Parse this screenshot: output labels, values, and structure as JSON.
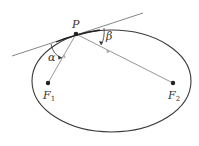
{
  "diagram": {
    "labels": {
      "point": "P",
      "alpha": "α",
      "beta": "β",
      "focus1_main": "F",
      "focus1_sub": "1",
      "focus2_main": "F",
      "focus2_sub": "2"
    },
    "colors": {
      "ellipse": "#3a3a3a",
      "tangent": "#555555",
      "focal_lines": "#8a8a8a",
      "points": "#222222",
      "background": "#ffffff"
    },
    "geometry": {
      "ellipse": {
        "cx": 111.5,
        "cy": 81,
        "rx": 79.5,
        "ry": 51
      },
      "P": {
        "x": 76,
        "y": 34
      },
      "F1": {
        "x": 48,
        "y": 83
      },
      "F2": {
        "x": 173,
        "y": 83
      },
      "tangent": {
        "x1": 12,
        "y1": 56,
        "x2": 143,
        "y2": 13
      }
    }
  }
}
